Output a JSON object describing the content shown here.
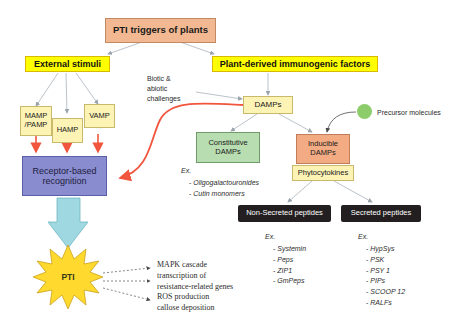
{
  "figure": {
    "title": "PTI triggers of plants"
  },
  "headers": {
    "external_stimuli": "External stimuli",
    "plant_derived": "Plant-derived immunogenic factors"
  },
  "stimuli": {
    "mamp": "MAMP\n/PAMP",
    "mamp_line1": "MAMP",
    "mamp_line2": "/PAMP",
    "hamp": "HAMP",
    "vamp": "VAMP"
  },
  "receptor": {
    "line1": "Receptor-based",
    "line2": "recognition"
  },
  "challenges": {
    "line1": "Biotic &",
    "line2": "abiotic",
    "line3": "challenges"
  },
  "damps": {
    "label": "DAMPs",
    "constitutive_line1": "Constitutive",
    "constitutive_line2": "DAMPs",
    "inducible_line1": "Inducible",
    "inducible_line2": "DAMPs",
    "phytocytokines": "Phytocytokines"
  },
  "precursor": {
    "label": "Precursor molecules",
    "color": "#8ccc6a"
  },
  "constitutive_examples": {
    "header": "Ex.",
    "items": [
      "Oligogalactouronides",
      "Cutin monomers"
    ]
  },
  "peptides": {
    "non_secreted_banner": "Non-Secreted peptides",
    "secreted_banner": "Secreted peptides",
    "non_secreted": {
      "header": "Ex.",
      "items": [
        "Systemin",
        "Peps",
        "ZIP1",
        "GmPeps"
      ]
    },
    "secreted": {
      "header": "Ex.",
      "items": [
        "HypSys",
        "PSK",
        "PSY 1",
        "PIPs",
        "SCOOP 12",
        "RALFs"
      ]
    }
  },
  "pti": {
    "label": "PTI",
    "star_color": "#ffd92e"
  },
  "outcomes": {
    "line1": "MAPK cascade",
    "line2": "transcription of",
    "line3": "resistance-related genes",
    "line4": "ROS production",
    "line5": "callose deposition"
  },
  "colors": {
    "title_box": "#f2b891",
    "highlight": "#ffff00",
    "pale_yellow": "#fdf3b5",
    "green": "#b7ddb0",
    "orange": "#f3ab84",
    "purple": "#8a8cd0",
    "dark": "#231f20",
    "red_arrow": "#f2553d",
    "cyan_arrow": "#9fd8e0"
  }
}
